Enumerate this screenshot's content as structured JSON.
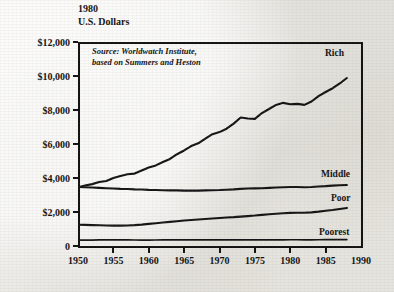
{
  "title": {
    "line1": "1980",
    "line2": "U.S. Dollars"
  },
  "source_note": {
    "line1": "Source: Worldwatch Institute,",
    "line2": "based on Summers and Heston"
  },
  "chart_data": {
    "type": "line",
    "xlabel": "",
    "ylabel": "1980 U.S. Dollars",
    "xlim": [
      1950,
      1990
    ],
    "ylim": [
      0,
      12000
    ],
    "grid": false,
    "legend_position": "inline-right",
    "annotations": [
      "Source: Worldwatch Institute,",
      "based on Summers and Heston"
    ],
    "ytick_labels": [
      "$12,000",
      "$10,000",
      "$8,000",
      "$6,000",
      "$4,000",
      "$2,000",
      "0"
    ],
    "ytick_values": [
      12000,
      10000,
      8000,
      6000,
      4000,
      2000,
      0
    ],
    "xtick_labels": [
      "1950",
      "1955",
      "1960",
      "1965",
      "1970",
      "1975",
      "1980",
      "1985",
      "1990"
    ],
    "xtick_values": [
      1950,
      1955,
      1960,
      1965,
      1970,
      1975,
      1980,
      1985,
      1990
    ],
    "x": [
      1950,
      1951,
      1952,
      1953,
      1954,
      1955,
      1956,
      1957,
      1958,
      1959,
      1960,
      1961,
      1962,
      1963,
      1964,
      1965,
      1966,
      1967,
      1968,
      1969,
      1970,
      1971,
      1972,
      1973,
      1974,
      1975,
      1976,
      1977,
      1978,
      1979,
      1980,
      1981,
      1982,
      1983,
      1984,
      1985,
      1986,
      1987,
      1988
    ],
    "series": [
      {
        "name": "Rich",
        "values": [
          3450,
          3560,
          3640,
          3760,
          3820,
          4000,
          4120,
          4220,
          4260,
          4440,
          4620,
          4740,
          4940,
          5120,
          5400,
          5620,
          5880,
          6040,
          6320,
          6580,
          6700,
          6900,
          7200,
          7560,
          7500,
          7480,
          7820,
          8060,
          8300,
          8420,
          8340,
          8360,
          8300,
          8500,
          8820,
          9060,
          9280,
          9560,
          9880
        ]
      },
      {
        "name": "Middle",
        "values": [
          3480,
          3460,
          3440,
          3420,
          3400,
          3380,
          3360,
          3350,
          3330,
          3320,
          3300,
          3290,
          3280,
          3270,
          3270,
          3260,
          3260,
          3260,
          3270,
          3280,
          3290,
          3310,
          3330,
          3360,
          3380,
          3390,
          3400,
          3420,
          3440,
          3460,
          3470,
          3470,
          3460,
          3470,
          3500,
          3520,
          3550,
          3570,
          3590
        ]
      },
      {
        "name": "Poor",
        "values": [
          1250,
          1240,
          1230,
          1220,
          1210,
          1200,
          1200,
          1210,
          1230,
          1260,
          1300,
          1340,
          1380,
          1420,
          1460,
          1500,
          1530,
          1560,
          1590,
          1620,
          1650,
          1680,
          1700,
          1730,
          1760,
          1790,
          1830,
          1870,
          1900,
          1930,
          1950,
          1960,
          1960,
          1980,
          2020,
          2070,
          2120,
          2180,
          2240
        ]
      },
      {
        "name": "Poorest",
        "values": [
          340,
          345,
          350,
          355,
          360,
          362,
          360,
          356,
          352,
          350,
          350,
          352,
          356,
          360,
          362,
          364,
          362,
          358,
          356,
          358,
          360,
          362,
          364,
          366,
          366,
          364,
          362,
          362,
          364,
          366,
          368,
          368,
          366,
          366,
          368,
          370,
          372,
          374,
          376
        ]
      }
    ]
  },
  "series_labels": [
    {
      "name": "Rich",
      "label": "Rich"
    },
    {
      "name": "Middle",
      "label": "Middle"
    },
    {
      "name": "Poor",
      "label": "Poor"
    },
    {
      "name": "Poorest",
      "label": "Poorest"
    }
  ]
}
